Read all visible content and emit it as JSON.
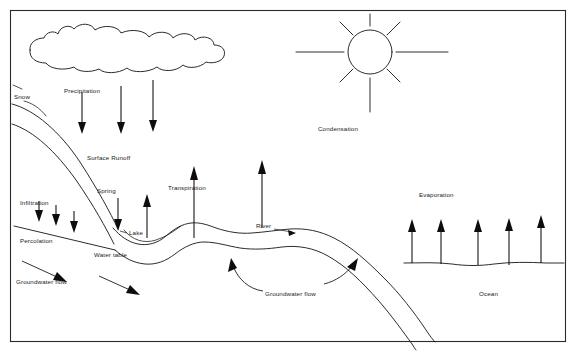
{
  "diagram": {
    "background_color": "#ffffff",
    "ink_color": "#141414",
    "labels": {
      "precipitation": "Precipitation",
      "snow": "Snow",
      "surface_runoff": "Surface Runoff",
      "infiltration": "Infiltration",
      "percolation": "Percolation",
      "spring": "Spring",
      "lake": "Lake",
      "water_table": "Water table",
      "groundwater_flow_left": "Groundwater flow",
      "groundwater_flow_right": "Groundwater flow",
      "transpiration": "Transpiration",
      "river": "River",
      "condensation": "Condensation",
      "evaporation": "Evaporation",
      "ocean": "Ocean"
    },
    "elements": {
      "cloud": "cloud-shape",
      "sun": "sun-shape",
      "sun_rays_count": 8,
      "precipitation_arrows_count": 3,
      "infiltration_arrows_count": 3,
      "evaporation_arrows_count": 5,
      "transpiration_arrows_count": 2,
      "groundwater_arrows_left_count": 2,
      "groundwater_arrows_right_count": 2
    }
  }
}
